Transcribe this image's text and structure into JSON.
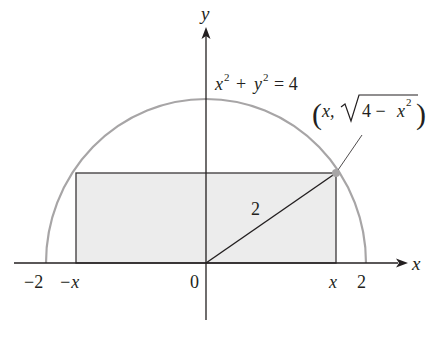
{
  "figure": {
    "axes": {
      "x_label": "x",
      "y_label": "y",
      "origin_label": "0",
      "ticks": {
        "neg_two": "−2",
        "neg_x": "−x",
        "x": "x",
        "two": "2"
      }
    },
    "curve": {
      "equation_lhs_x": "x",
      "equation_lhs_y": "y",
      "equation_exp": "2",
      "equation_plus": "+",
      "equation_rhs": "= 4",
      "description": "upper semicircle of radius 2"
    },
    "point": {
      "label_open": "(",
      "label_x": "x,",
      "label_radicand_a": "4 −",
      "label_radicand_x": "x",
      "label_radicand_exp": "2",
      "label_close": ")"
    },
    "radius_label": "2",
    "colors": {
      "axis": "#231f20",
      "curve": "#a7a5a6",
      "rect_fill": "#ececec",
      "rect_stroke": "#3b3839",
      "point": "#a7a5a6"
    }
  }
}
